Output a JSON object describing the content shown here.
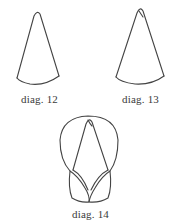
{
  "diagrams": [
    {
      "id": "12",
      "caption": "diag. 12",
      "subject": "paper cone, plain"
    },
    {
      "id": "13",
      "caption": "diag. 13",
      "subject": "paper cone with folded tip"
    },
    {
      "id": "14",
      "caption": "diag. 14",
      "subject": "cone with two lobes folded around it"
    }
  ],
  "colors": {
    "background": "#ffffff",
    "line": "#444444",
    "text": "#3a3a3a"
  }
}
